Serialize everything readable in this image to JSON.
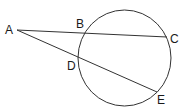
{
  "diagram": {
    "type": "geometry",
    "stroke_color": "#333333",
    "circle": {
      "cx": 124.5,
      "cy": 58,
      "rx": 46.5,
      "ry": 48
    },
    "points": {
      "A": {
        "label": "A",
        "x": 17,
        "y": 30,
        "label_x": 5,
        "label_y": 34
      },
      "B": {
        "label": "B",
        "x": 86,
        "y": 33,
        "label_x": 76,
        "label_y": 28
      },
      "C": {
        "label": "C",
        "x": 167,
        "y": 37,
        "label_x": 170,
        "label_y": 43
      },
      "D": {
        "label": "D",
        "x": 79,
        "y": 60,
        "label_x": 67,
        "label_y": 70
      },
      "E": {
        "label": "E",
        "x": 157,
        "y": 92,
        "label_x": 157,
        "label_y": 104
      }
    },
    "segments": [
      {
        "name": "secant-ABC",
        "from": "A",
        "to": "C"
      },
      {
        "name": "secant-ADE",
        "from": "A",
        "to": "E"
      }
    ]
  }
}
